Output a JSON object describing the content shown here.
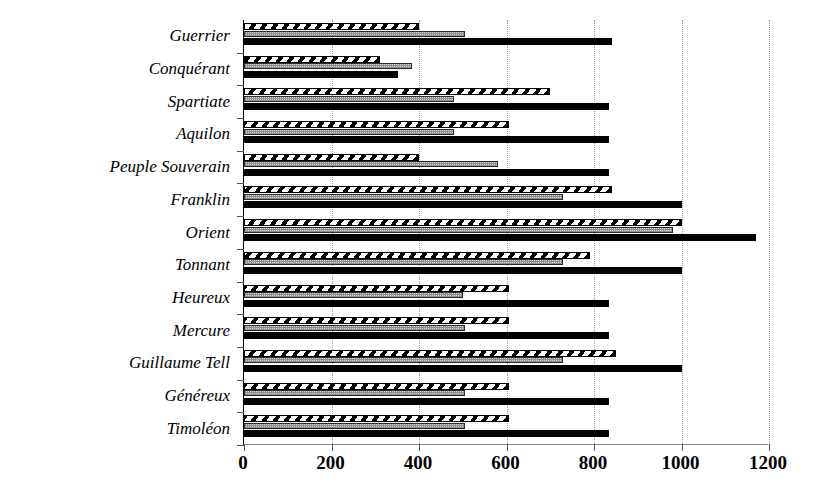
{
  "chart_data": {
    "type": "bar",
    "orientation": "horizontal",
    "title": "",
    "subtitle": "",
    "xlabel": "",
    "ylabel": "",
    "xlim": [
      0,
      1200
    ],
    "xticks": [
      0,
      200,
      400,
      600,
      800,
      1000,
      1200
    ],
    "xtick_labels": [
      "0",
      "200",
      "400",
      "600",
      "800",
      "1000",
      "1200"
    ],
    "grid": "vertical-dotted",
    "legend": "none",
    "legend_position": "none",
    "categories": [
      "Guerrier",
      "Conquérant",
      "Spartiate",
      "Aquilon",
      "Peuple Souverain",
      "Franklin",
      "Orient",
      "Tonnant",
      "Heureux",
      "Mercure",
      "Guillaume Tell",
      "Généreux",
      "Timoléon"
    ],
    "series": [
      {
        "name": "series-1",
        "pattern": "diagonal-hatch",
        "color": "#000000",
        "values": [
          400,
          310,
          700,
          605,
          400,
          840,
          1000,
          790,
          605,
          605,
          850,
          605,
          605
        ]
      },
      {
        "name": "series-2",
        "pattern": "gray-stipple",
        "color": "#d9d9d9",
        "values": [
          505,
          385,
          480,
          480,
          580,
          730,
          980,
          730,
          500,
          505,
          730,
          505,
          505
        ]
      },
      {
        "name": "series-3",
        "pattern": "solid",
        "color": "#000000",
        "values": [
          840,
          352,
          835,
          835,
          835,
          1000,
          1170,
          1000,
          835,
          835,
          1000,
          835,
          835
        ]
      }
    ]
  },
  "axis": {
    "x_axis_color": "#8a8a8a",
    "y_axis_color": "#000000",
    "gridline_color": "#9a9a9a"
  }
}
